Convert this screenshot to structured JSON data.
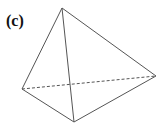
{
  "figure": {
    "label": "(c)",
    "vertices": {
      "top": [
        62,
        8
      ],
      "left": [
        22,
        89
      ],
      "bottom": [
        74,
        122
      ],
      "right": [
        156,
        76
      ]
    },
    "edges_solid": [
      [
        "top",
        "left"
      ],
      [
        "top",
        "bottom"
      ],
      [
        "top",
        "right"
      ],
      [
        "left",
        "bottom"
      ],
      [
        "bottom",
        "right"
      ]
    ],
    "edges_dashed": [
      [
        "left",
        "right"
      ]
    ],
    "line_color": "#555555"
  }
}
